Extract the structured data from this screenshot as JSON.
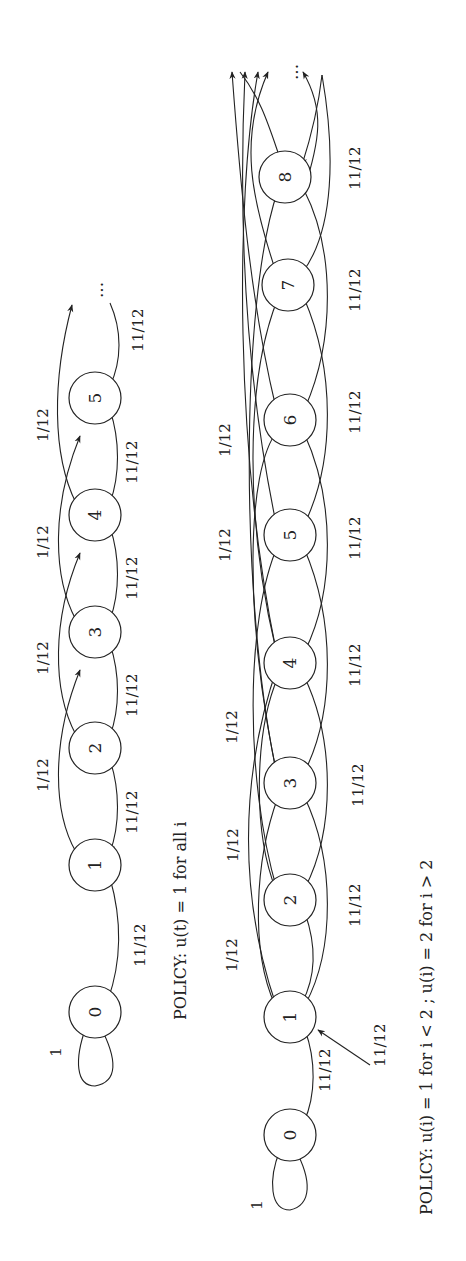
{
  "figure": {
    "orientation": "rotated 90 degrees counter-clockwise",
    "diagrams": [
      {
        "id": "top",
        "caption": "POLICY: u(t) = 1 for all i",
        "states": [
          "0",
          "1",
          "2",
          "3",
          "4",
          "5"
        ],
        "continuation": "...",
        "self_loop_label": "1",
        "down_label": "11/12",
        "up_label": "1/12",
        "edge_labels": {
          "down": [
            "11/12",
            "11/12",
            "11/12",
            "11/12",
            "11/12",
            "11/12"
          ],
          "up": [
            "1/12",
            "1/12",
            "1/12",
            "1/12"
          ]
        }
      },
      {
        "id": "bottom",
        "caption": "POLICY: u(i) = 1 for i < 2 ; u(i) = 2 for i > 2",
        "states": [
          "0",
          "1",
          "2",
          "3",
          "4",
          "5",
          "6",
          "7",
          "8"
        ],
        "continuation": "...",
        "self_loop_label": "1",
        "down_label": "11/12",
        "up_label": "1/12",
        "edge_labels": {
          "down": [
            "11/12",
            "11/12",
            "11/12",
            "11/12",
            "11/12",
            "11/12",
            "11/12",
            "11/12",
            "11/12"
          ],
          "up": [
            "1/12",
            "1/12",
            "1/12",
            "1/12",
            "1/12",
            "1/12"
          ]
        }
      }
    ]
  }
}
